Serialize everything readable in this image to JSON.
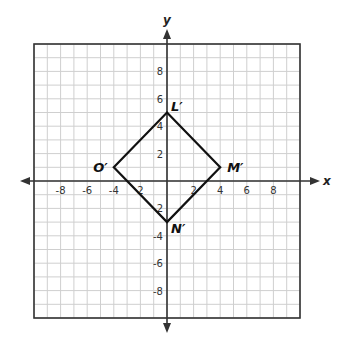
{
  "diagram": {
    "type": "coordinate-plane",
    "x_axis_label": "x",
    "y_axis_label": "y",
    "range": {
      "xmin": -10,
      "xmax": 10,
      "ymin": -10,
      "ymax": 10
    },
    "x_ticks": [
      {
        "value": -8,
        "label": "-8"
      },
      {
        "value": -6,
        "label": "-6"
      },
      {
        "value": -4,
        "label": "-4"
      },
      {
        "value": -2,
        "label": "2"
      },
      {
        "value": 2,
        "label": "2"
      },
      {
        "value": 4,
        "label": "4"
      },
      {
        "value": 6,
        "label": "6"
      },
      {
        "value": 8,
        "label": "8"
      }
    ],
    "y_ticks": [
      {
        "value": 8,
        "label": "8"
      },
      {
        "value": 6,
        "label": "6"
      },
      {
        "value": 4,
        "label": "4"
      },
      {
        "value": 2,
        "label": "2"
      },
      {
        "value": -2,
        "label": "2"
      },
      {
        "value": -4,
        "label": "-4"
      },
      {
        "value": -6,
        "label": "-6"
      },
      {
        "value": -8,
        "label": "-8"
      }
    ],
    "shape": {
      "name": "rhombus L'M'N'O'",
      "vertices": [
        {
          "label": "L′",
          "x": 0,
          "y": 5
        },
        {
          "label": "M′",
          "x": 4,
          "y": 1
        },
        {
          "label": "N′",
          "x": 0,
          "y": -3
        },
        {
          "label": "O′",
          "x": -4,
          "y": 1
        }
      ]
    },
    "colors": {
      "grid_minor": "#cfcfcf",
      "grid_border": "#333333",
      "axis": "#333333",
      "shape_stroke": "#111111"
    }
  }
}
